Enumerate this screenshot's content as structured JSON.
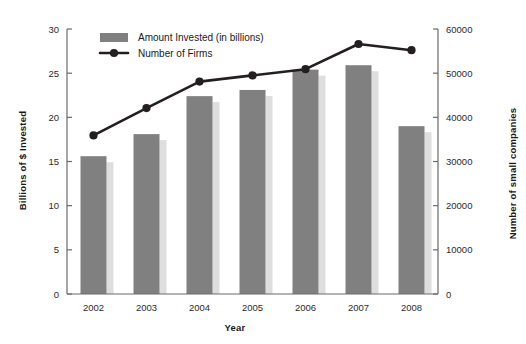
{
  "chart_data": {
    "type": "bar",
    "title": "",
    "subtitle": "",
    "xlabel": "Year",
    "ylabel": "Billions of $ Invested",
    "y2label": "Number of small companies",
    "categories": [
      "2002",
      "2003",
      "2004",
      "2005",
      "2006",
      "2007",
      "2008"
    ],
    "ylim": [
      0,
      30
    ],
    "yticks": [
      0,
      5,
      10,
      15,
      20,
      25,
      30
    ],
    "ytick_labels": [
      "0",
      "5",
      "10",
      "15",
      "20",
      "25",
      "30"
    ],
    "y2lim": [
      0,
      60000
    ],
    "y2ticks": [
      0,
      10000,
      20000,
      30000,
      40000,
      50000,
      60000
    ],
    "y2tick_labels": [
      "0",
      "10000",
      "20000",
      "30000",
      "40000",
      "50000",
      "60000"
    ],
    "grid": false,
    "legend_position": "top-left-inside",
    "series": [
      {
        "name": "Amount Invested (in billions)",
        "type": "bar",
        "axis": "left",
        "color": "#808080",
        "values": [
          15.6,
          18.1,
          22.4,
          23.1,
          25.4,
          25.9,
          19.0
        ]
      },
      {
        "name": "Number of Firms",
        "type": "line",
        "axis": "right",
        "color": "#231f20",
        "values": [
          35900,
          42100,
          48100,
          49500,
          50900,
          56600,
          55200
        ]
      }
    ]
  },
  "legend": {
    "items": [
      {
        "label": "Amount Invested (in billions)",
        "marker": "bar-swatch",
        "color": "#808080"
      },
      {
        "label": "Number of Firms",
        "marker": "line-with-dot",
        "color": "#231f20"
      }
    ]
  }
}
